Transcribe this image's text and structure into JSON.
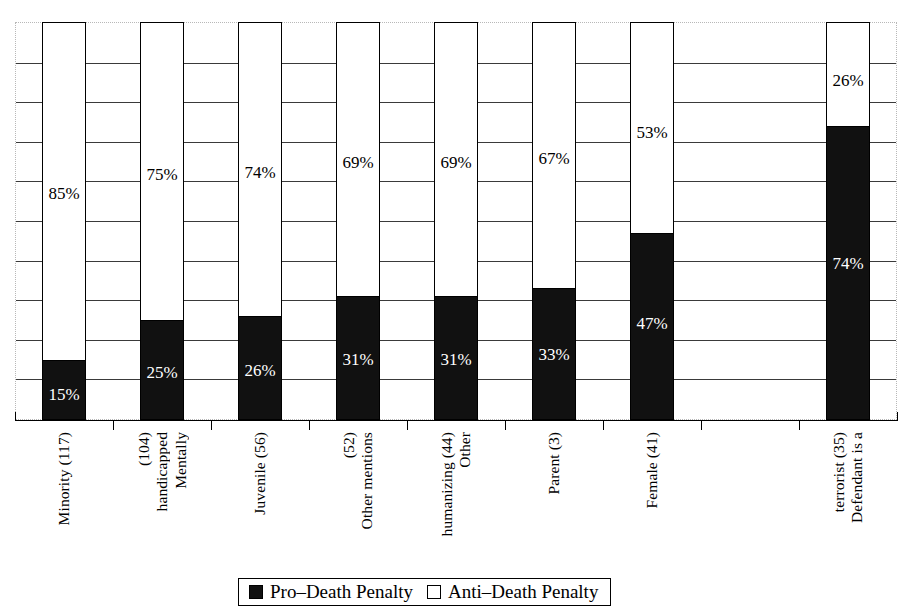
{
  "chart_data": {
    "type": "bar",
    "subtype": "stacked-100-percent",
    "title": "",
    "xlabel": "",
    "ylabel": "",
    "ylim": [
      0,
      100
    ],
    "grid": true,
    "gridline_step": 10,
    "gridline_values": [
      10,
      20,
      30,
      40,
      50,
      60,
      70,
      80,
      90
    ],
    "axis_tick_labels": [],
    "legend_position": "bottom-center",
    "categories": [
      "Minority (117)",
      "Mentally handicapped (104)",
      "Juvenile (56)",
      "Other mentions (52)",
      "Other humanizing (44)",
      "Parent (3)",
      "Female (41)",
      "",
      "Defendant is a terrorist (35)"
    ],
    "category_lines": [
      [
        "Minority (117)"
      ],
      [
        "Mentally",
        "handicapped",
        "(104)"
      ],
      [
        "Juvenile (56)"
      ],
      [
        "Other mentions",
        "(52)"
      ],
      [
        "Other",
        "humanizing (44)"
      ],
      [
        "Parent (3)"
      ],
      [
        "Female (41)"
      ],
      [],
      [
        "Defendant is a",
        "terrorist (35)"
      ]
    ],
    "series": [
      {
        "name": "Pro–Death Penalty",
        "color": "#111111",
        "values": [
          15,
          25,
          26,
          31,
          31,
          33,
          47,
          null,
          74
        ],
        "labels": [
          "15%",
          "25%",
          "26%",
          "31%",
          "31%",
          "33%",
          "47%",
          "",
          "74%"
        ]
      },
      {
        "name": "Anti–Death Penalty",
        "color": "#ffffff",
        "values": [
          85,
          75,
          74,
          69,
          69,
          67,
          53,
          null,
          26
        ],
        "labels": [
          "85%",
          "75%",
          "74%",
          "69%",
          "69%",
          "67%",
          "53%",
          "",
          "26%"
        ]
      }
    ],
    "empty_slots": [
      7
    ]
  },
  "legend": {
    "items": [
      {
        "label": "Pro–Death Penalty",
        "swatch": "filled-square-icon"
      },
      {
        "label": "Anti–Death Penalty",
        "swatch": "hollow-square-icon"
      }
    ]
  }
}
